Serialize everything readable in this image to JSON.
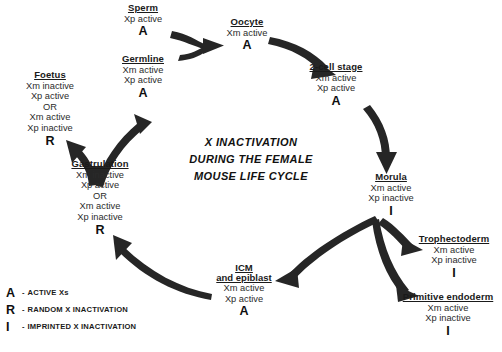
{
  "title": {
    "line1": "X INACTIVATION",
    "line2": "DURING THE FEMALE",
    "line3": "MOUSE LIFE CYCLE"
  },
  "colors": {
    "background": "#ffffff",
    "text": "#1a1a1a",
    "arrow": "#262626"
  },
  "nodes": {
    "sperm": {
      "name": "Sperm",
      "states": [
        "Xp active"
      ],
      "code": "A"
    },
    "germline": {
      "name": "Germline",
      "states": [
        "Xm active",
        "Xp active"
      ],
      "code": "A"
    },
    "oocyte": {
      "name": "Oocyte",
      "states": [
        "Xm active"
      ],
      "code": "A"
    },
    "two_cell": {
      "name": "2-cell stage",
      "states": [
        "Xm active",
        "Xp active"
      ],
      "code": "A"
    },
    "morula": {
      "name": "Morula",
      "states": [
        "Xm active",
        "Xp inactive"
      ],
      "code": "I"
    },
    "trophectoderm": {
      "name": "Trophectoderm",
      "states": [
        "Xm active",
        "Xp inactive"
      ],
      "code": "I"
    },
    "primitive_endoderm": {
      "name": "Primitive endoderm",
      "states": [
        "Xm active",
        "Xp inactive"
      ],
      "code": "I"
    },
    "icm": {
      "name": "ICM",
      "name2": "and epiblast",
      "states": [
        "Xm active",
        "Xp active"
      ],
      "code": "A"
    },
    "gastrulation": {
      "name": "Gastrulation",
      "states": [
        "Xm inactive",
        "Xp active"
      ],
      "or": "OR",
      "states2": [
        "Xm active",
        "Xp inactive"
      ],
      "code": "R"
    },
    "foetus": {
      "name": "Foetus",
      "states": [
        "Xm inactive",
        "Xp active"
      ],
      "or": "OR",
      "states2": [
        "Xm active",
        "Xp inactive"
      ],
      "code": "R"
    }
  },
  "legend": [
    {
      "key": "A",
      "dash": "-",
      "text": "ACTIVE Xs"
    },
    {
      "key": "R",
      "dash": "-",
      "text": "RANDOM X INACTIVATION"
    },
    {
      "key": "I",
      "dash": "-",
      "text": "IMPRINTED X INACTIVATION"
    }
  ]
}
